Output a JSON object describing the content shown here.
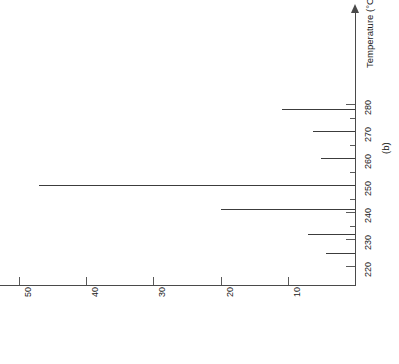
{
  "figure": {
    "panel_label": "(b)",
    "axis_title": "Temperature (°C)",
    "temperature_ticks": [
      {
        "value": 220,
        "label": "220",
        "major": true
      },
      {
        "value": 225,
        "label": "",
        "major": false
      },
      {
        "value": 230,
        "label": "230",
        "major": true
      },
      {
        "value": 235,
        "label": "",
        "major": false
      },
      {
        "value": 240,
        "label": "240",
        "major": true
      },
      {
        "value": 245,
        "label": "",
        "major": false
      },
      {
        "value": 250,
        "label": "250",
        "major": true
      },
      {
        "value": 255,
        "label": "",
        "major": false
      },
      {
        "value": 260,
        "label": "260",
        "major": true
      },
      {
        "value": 265,
        "label": "",
        "major": false
      },
      {
        "value": 270,
        "label": "270",
        "major": true
      },
      {
        "value": 275,
        "label": "",
        "major": false
      },
      {
        "value": 280,
        "label": "280",
        "major": true
      }
    ],
    "intensity_ticks": [
      {
        "value": 10,
        "label": "10"
      },
      {
        "value": 20,
        "label": "20"
      },
      {
        "value": 30,
        "label": "30"
      },
      {
        "value": 40,
        "label": "40"
      },
      {
        "value": 50,
        "label": "50"
      }
    ]
  },
  "chart_data": {
    "type": "bar",
    "title": "",
    "subtitle": "",
    "panel": "(b)",
    "orientation": "horizontal",
    "xlabel": "Temperature (°C)",
    "ylabel": "",
    "xlim": [
      216,
      286
    ],
    "ylim": [
      0,
      52
    ],
    "grid": false,
    "legend": null,
    "categories": [
      225,
      232,
      241,
      250,
      260,
      270,
      278
    ],
    "values": [
      4.3,
      7.0,
      20.0,
      47.0,
      5.0,
      6.3,
      10.8
    ],
    "x_tick_labels": [
      "220",
      "230",
      "240",
      "250",
      "260",
      "270",
      "280"
    ],
    "y_tick_labels": [
      "10",
      "20",
      "30",
      "40",
      "50"
    ],
    "annotations": [
      "(b)"
    ]
  },
  "colors": {
    "axis": "#4a4a4a",
    "peak": "#3c3c3c",
    "text": "#1a1a1a",
    "background": "#ffffff"
  }
}
